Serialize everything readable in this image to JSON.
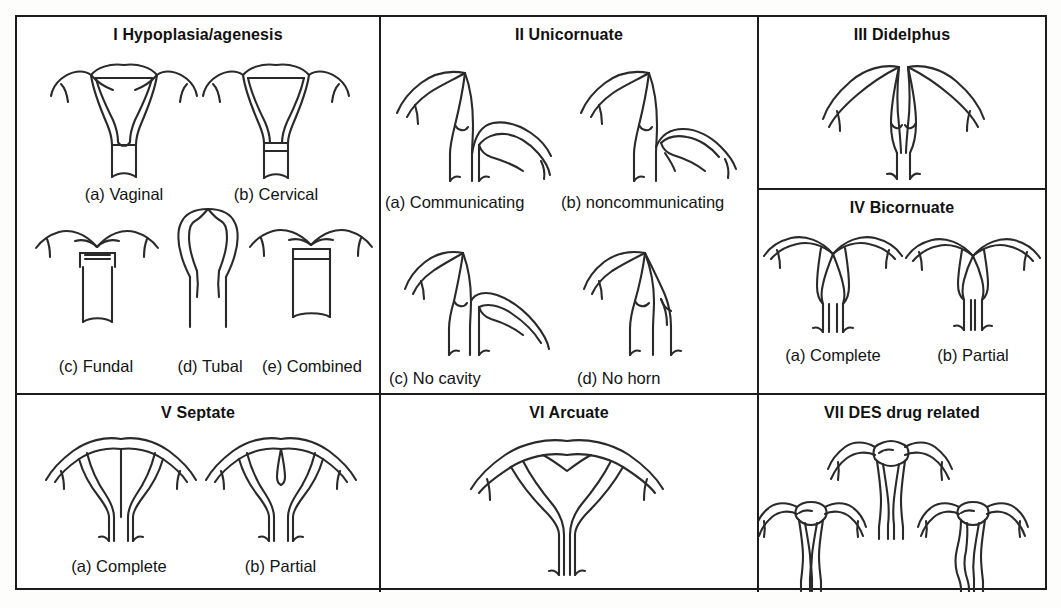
{
  "figure": {
    "background_color": "#ffffff",
    "line_color": "#2a2a2a",
    "border_color": "#1c1c1c"
  },
  "panels": [
    {
      "id": "hypoplasia",
      "title": "I Hypoplasia/agenesis",
      "labels": [
        {
          "key": "a",
          "text": "(a) Vaginal"
        },
        {
          "key": "b",
          "text": "(b) Cervical"
        },
        {
          "key": "c",
          "text": "(c) Fundal"
        },
        {
          "key": "d",
          "text": "(d) Tubal"
        },
        {
          "key": "e",
          "text": "(e) Combined"
        }
      ]
    },
    {
      "id": "unicornuate",
      "title": "II Unicornuate",
      "labels": [
        {
          "key": "a",
          "text": "(a) Communicating"
        },
        {
          "key": "b",
          "text": "(b) noncommunicating"
        },
        {
          "key": "c",
          "text": "(c) No cavity"
        },
        {
          "key": "d",
          "text": "(d) No horn"
        }
      ]
    },
    {
      "id": "didelphus",
      "title": "III Didelphus",
      "labels": []
    },
    {
      "id": "bicornuate",
      "title": "IV Bicornuate",
      "labels": [
        {
          "key": "a",
          "text": "(a) Complete"
        },
        {
          "key": "b",
          "text": "(b) Partial"
        }
      ]
    },
    {
      "id": "septate",
      "title": "V Septate",
      "labels": [
        {
          "key": "a",
          "text": "(a) Complete"
        },
        {
          "key": "b",
          "text": "(b) Partial"
        }
      ]
    },
    {
      "id": "arcuate",
      "title": "VI Arcuate",
      "labels": []
    },
    {
      "id": "des",
      "title": "VII DES drug related",
      "labels": []
    }
  ]
}
